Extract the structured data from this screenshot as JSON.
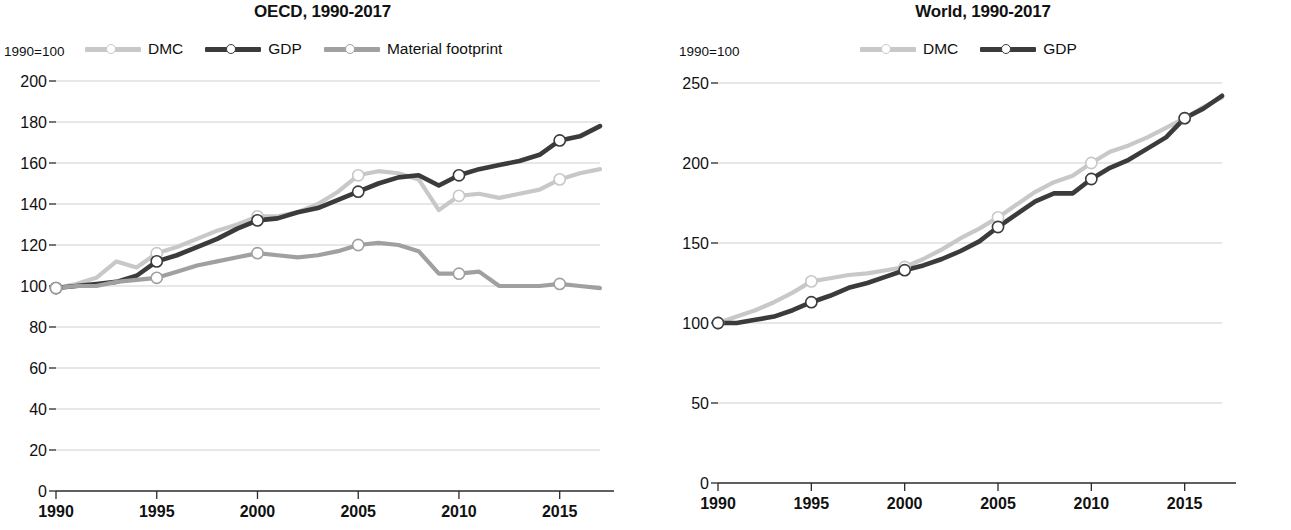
{
  "figure": {
    "panels": [
      {
        "id": "oecd",
        "title": "OECD, 1990-2017",
        "axis_note": "1990=100",
        "legend": [
          {
            "name": "dmc",
            "label": "DMC",
            "color": "#c8c8c8"
          },
          {
            "name": "gdp",
            "label": "GDP",
            "color": "#3b3b3b"
          },
          {
            "name": "material-footprint",
            "label": "Material footprint",
            "color": "#a0a0a0"
          }
        ]
      },
      {
        "id": "world",
        "title": "World, 1990-2017",
        "axis_note": "1990=100",
        "legend": [
          {
            "name": "dmc",
            "label": "DMC",
            "color": "#c8c8c8"
          },
          {
            "name": "gdp",
            "label": "GDP",
            "color": "#3b3b3b"
          }
        ]
      }
    ]
  },
  "chart_data": [
    {
      "type": "line",
      "title": "OECD, 1990-2017",
      "xlabel": "",
      "ylabel": "1990=100",
      "xlim": [
        1990,
        2017
      ],
      "ylim": [
        0,
        200
      ],
      "yticks": [
        0,
        20,
        40,
        60,
        80,
        100,
        120,
        140,
        160,
        180,
        200
      ],
      "xticks": [
        1990,
        1995,
        2000,
        2005,
        2010,
        2015
      ],
      "grid": true,
      "legend_position": "top",
      "x": [
        1990,
        1991,
        1992,
        1993,
        1994,
        1995,
        1996,
        1997,
        1998,
        1999,
        2000,
        2001,
        2002,
        2003,
        2004,
        2005,
        2006,
        2007,
        2008,
        2009,
        2010,
        2011,
        2012,
        2013,
        2014,
        2015,
        2016,
        2017
      ],
      "series": [
        {
          "name": "DMC",
          "color": "#c8c8c8",
          "marker_years": [
            1990,
            1995,
            2000,
            2005,
            2010,
            2015
          ],
          "values": [
            99,
            101,
            104,
            112,
            109,
            116,
            119,
            123,
            127,
            130,
            134,
            134,
            136,
            140,
            146,
            154,
            156,
            155,
            152,
            137,
            144,
            145,
            143,
            145,
            147,
            152,
            155,
            157
          ]
        },
        {
          "name": "GDP",
          "color": "#3b3b3b",
          "marker_years": [
            1990,
            1995,
            2000,
            2005,
            2010,
            2015
          ],
          "values": [
            99,
            100,
            101,
            102,
            105,
            112,
            115,
            119,
            123,
            128,
            132,
            133,
            136,
            138,
            142,
            146,
            150,
            153,
            154,
            149,
            154,
            157,
            159,
            161,
            164,
            171,
            173,
            178
          ]
        },
        {
          "name": "Material footprint",
          "color": "#a0a0a0",
          "marker_years": [
            1990,
            1995,
            2000,
            2005,
            2010,
            2015
          ],
          "values": [
            99,
            100,
            100,
            102,
            103,
            104,
            107,
            110,
            112,
            114,
            116,
            115,
            114,
            115,
            117,
            120,
            121,
            120,
            117,
            106,
            106,
            107,
            100,
            100,
            100,
            101,
            100,
            99
          ]
        }
      ]
    },
    {
      "type": "line",
      "title": "World, 1990-2017",
      "xlabel": "",
      "ylabel": "1990=100",
      "xlim": [
        1990,
        2017
      ],
      "ylim": [
        0,
        250
      ],
      "yticks": [
        0,
        50,
        100,
        150,
        200,
        250
      ],
      "xticks": [
        1990,
        1995,
        2000,
        2005,
        2010,
        2015
      ],
      "grid": true,
      "legend_position": "top",
      "x": [
        1990,
        1991,
        1992,
        1993,
        1994,
        1995,
        1996,
        1997,
        1998,
        1999,
        2000,
        2001,
        2002,
        2003,
        2004,
        2005,
        2006,
        2007,
        2008,
        2009,
        2010,
        2011,
        2012,
        2013,
        2014,
        2015,
        2016,
        2017
      ],
      "series": [
        {
          "name": "DMC",
          "color": "#c8c8c8",
          "marker_years": [
            1990,
            1995,
            2000,
            2005,
            2010,
            2015
          ],
          "values": [
            100,
            104,
            108,
            113,
            119,
            126,
            128,
            130,
            131,
            133,
            135,
            140,
            146,
            153,
            159,
            166,
            174,
            182,
            188,
            192,
            200,
            207,
            211,
            216,
            222,
            228,
            235,
            241
          ]
        },
        {
          "name": "GDP",
          "color": "#3b3b3b",
          "marker_years": [
            1990,
            1995,
            2000,
            2005,
            2010,
            2015
          ],
          "values": [
            100,
            100,
            102,
            104,
            108,
            113,
            117,
            122,
            125,
            129,
            133,
            136,
            140,
            145,
            151,
            160,
            168,
            176,
            181,
            181,
            190,
            197,
            202,
            209,
            216,
            228,
            234,
            242
          ]
        }
      ]
    }
  ]
}
